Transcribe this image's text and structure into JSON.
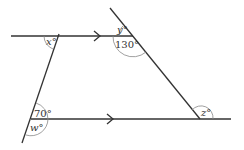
{
  "diagram": {
    "type": "geometry-angles-parallel-lines",
    "colors": {
      "line": "#333333",
      "arc": "#888888",
      "text": "#333333",
      "background": "#ffffff"
    },
    "lines": {
      "top_parallel": {
        "description": "upper horizontal line with arrow (parallel marker)"
      },
      "bottom_parallel": {
        "description": "lower horizontal line with arrow (parallel marker)"
      },
      "left_transversal": {
        "description": "left slanted line"
      },
      "right_transversal": {
        "description": "right slanted line"
      }
    },
    "angles": {
      "x": {
        "label": "x°",
        "var": "x",
        "unit": "°"
      },
      "y": {
        "label": "y°",
        "var": "y",
        "unit": "°"
      },
      "a130": {
        "label": "130°",
        "value": 130
      },
      "a70": {
        "label": "70°",
        "value": 70
      },
      "w": {
        "label": "w°",
        "var": "w",
        "unit": "°"
      },
      "z": {
        "label": "z°",
        "var": "z",
        "unit": "°"
      }
    }
  }
}
